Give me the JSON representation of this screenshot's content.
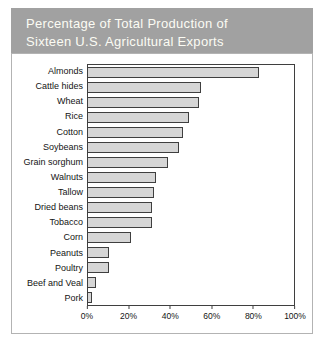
{
  "header": {
    "line1": "Percentage of Total Production of",
    "line2": "Sixteen U.S. Agricultural Exports"
  },
  "colors": {
    "header_bg": "#a1a1a1",
    "header_text": "#fcfcf4",
    "bar_fill": "#d6d6d6",
    "bar_border": "#3f3f3f",
    "plot_border": "#3f3f3f",
    "area_border": "#b3b3b3"
  },
  "chart_data": {
    "type": "bar",
    "orientation": "horizontal",
    "title": "Percentage of Total Production of Sixteen U.S. Agricultural Exports",
    "categories": [
      "Almonds",
      "Cattle hides",
      "Wheat",
      "Rice",
      "Cotton",
      "Soybeans",
      "Grain sorghum",
      "Walnuts",
      "Tallow",
      "Dried beans",
      "Tobacco",
      "Corn",
      "Peanuts",
      "Poultry",
      "Beef and Veal",
      "Pork"
    ],
    "values": [
      83,
      55,
      54,
      49,
      46,
      44,
      39,
      33,
      32,
      31,
      31,
      21,
      10,
      10,
      4,
      2
    ],
    "xlabel": "",
    "ylabel": "",
    "xlim": [
      0,
      100
    ],
    "x_ticks": [
      {
        "value": 0,
        "label": "0%"
      },
      {
        "value": 20,
        "label": "20%"
      },
      {
        "value": 40,
        "label": "40%"
      },
      {
        "value": 60,
        "label": "60%"
      },
      {
        "value": 80,
        "label": "80%"
      },
      {
        "value": 100,
        "label": "100%"
      }
    ],
    "grid": false,
    "legend": false
  }
}
